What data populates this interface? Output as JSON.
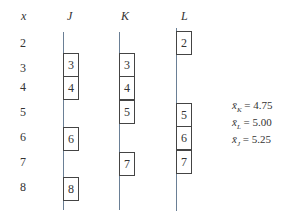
{
  "headers": {
    "x": "x",
    "j": "J",
    "k": "K",
    "l": "L"
  },
  "x_values": [
    "2",
    "3",
    "4",
    "5",
    "6",
    "7",
    "8"
  ],
  "columns": {
    "J": [
      "3",
      "4",
      "6",
      "8"
    ],
    "K": [
      "3",
      "4",
      "5",
      "7"
    ],
    "L": [
      "2",
      "5",
      "6",
      "7"
    ]
  },
  "stats": [
    {
      "symbol": "x̄",
      "sub": "K",
      "value": "= 4.75"
    },
    {
      "symbol": "x̄",
      "sub": "L",
      "value": "= 5.00"
    },
    {
      "symbol": "x̄",
      "sub": "J",
      "value": "= 5.25"
    }
  ]
}
